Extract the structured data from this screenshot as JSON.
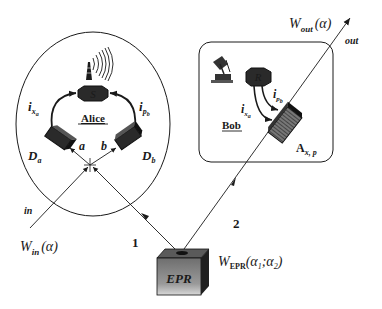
{
  "alice": {
    "title": "Alice",
    "source_label": "S",
    "detector_a_label": "D",
    "detector_a_sub": "a",
    "detector_b_label": "D",
    "detector_b_sub": "b",
    "current_x_label": "i",
    "current_x_sub": "x",
    "current_x_subsub": "a",
    "current_p_label": "i",
    "current_p_sub": "p",
    "current_p_subsub": "b",
    "port_a": "a",
    "port_b": "b",
    "antenna_icon": "radio-tower-icon"
  },
  "bob": {
    "title": "Bob",
    "receiver_label": "R",
    "current_x_label": "i",
    "current_x_sub": "x",
    "current_x_subsub": "a",
    "current_p_label": "i",
    "current_p_sub": "p",
    "current_p_subsub": "b",
    "modulator_label": "A",
    "modulator_sub": "x, p",
    "dish_icon": "satellite-dish-icon"
  },
  "beams": {
    "input_label": "in",
    "output_label": "out",
    "beam1_label": "1",
    "beam2_label": "2"
  },
  "wigner": {
    "in_W": "W",
    "in_sub": "in",
    "in_arg": "(α)",
    "out_W": "W",
    "out_sub": "out",
    "out_arg": "(α)",
    "epr_W": "W",
    "epr_sub": "EPR",
    "epr_arg": "(α",
    "epr_arg1_sub": "1",
    "epr_sep": ";α",
    "epr_arg2_sub": "2",
    "epr_close": ")"
  },
  "source": {
    "label": "EPR"
  },
  "colors": {
    "line": "#1a1a1a",
    "box_front": "#8a8a8a",
    "box_top": "#5a5a5a",
    "box_side": "#2a2a2a",
    "device_dark": "#222222"
  }
}
